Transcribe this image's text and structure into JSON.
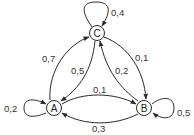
{
  "diagram": {
    "type": "markov-chain-state-diagram",
    "nodes": [
      {
        "id": "A",
        "label": "A"
      },
      {
        "id": "B",
        "label": "B"
      },
      {
        "id": "C",
        "label": "C"
      }
    ],
    "edges": [
      {
        "from": "A",
        "to": "A",
        "label": "0,2"
      },
      {
        "from": "A",
        "to": "B",
        "label": "0,1"
      },
      {
        "from": "A",
        "to": "C",
        "label": "0,7"
      },
      {
        "from": "B",
        "to": "A",
        "label": "0,3"
      },
      {
        "from": "B",
        "to": "B",
        "label": "0,5"
      },
      {
        "from": "B",
        "to": "C",
        "label": "0,2"
      },
      {
        "from": "C",
        "to": "A",
        "label": "0,5"
      },
      {
        "from": "C",
        "to": "B",
        "label": "0,1"
      },
      {
        "from": "C",
        "to": "C",
        "label": "0,4"
      }
    ]
  },
  "colors": {
    "stroke": "#2a2a2a",
    "text": "#333333",
    "background": "#ffffff"
  }
}
